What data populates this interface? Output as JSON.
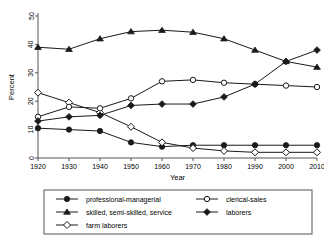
{
  "chart_data": {
    "type": "line",
    "title": "",
    "xlabel": "Year",
    "ylabel": "Percent",
    "x": [
      1920,
      1930,
      1940,
      1950,
      1960,
      1970,
      1980,
      1990,
      2000,
      2010
    ],
    "xlim": [
      1920,
      2010
    ],
    "ylim": [
      0,
      50
    ],
    "xticks": [
      "1920",
      "1930",
      "1940",
      "1950",
      "1960",
      "1970",
      "1980",
      "1990",
      "2000",
      "2010"
    ],
    "yticks": [
      "0",
      "10",
      "20",
      "30",
      "40",
      "50"
    ],
    "grid": false,
    "legend_position": "bottom",
    "series": [
      {
        "name": "professional-managerial",
        "marker": "filled-circle",
        "values": [
          10.5,
          10.0,
          9.5,
          5.5,
          4.0,
          4.5,
          4.5,
          4.5,
          4.5,
          4.5
        ]
      },
      {
        "name": "skilled, semi-skilled, service",
        "marker": "filled-triangle",
        "values": [
          39.0,
          38.3,
          42.0,
          44.5,
          45.0,
          44.3,
          42.0,
          38.0,
          34.0,
          32.0
        ]
      },
      {
        "name": "farm laborers",
        "marker": "open-diamond",
        "values": [
          23.0,
          19.5,
          16.0,
          11.0,
          5.5,
          3.5,
          2.5,
          2.0,
          2.0,
          2.0
        ]
      },
      {
        "name": "clerical-sales",
        "marker": "open-circle",
        "values": [
          14.5,
          18.0,
          17.5,
          21.0,
          27.0,
          27.5,
          26.5,
          26.0,
          25.5,
          25.0
        ]
      },
      {
        "name": "laborers",
        "marker": "filled-diamond",
        "values": [
          13.0,
          14.5,
          15.0,
          18.5,
          19.0,
          19.0,
          21.5,
          26.0,
          34.0,
          38.0
        ]
      }
    ]
  },
  "legend": {
    "entries": [
      {
        "label": "professional-managerial",
        "marker": "filled-circle"
      },
      {
        "label": "clerical-sales",
        "marker": "open-circle"
      },
      {
        "label": "skilled, semi-skilled, service",
        "marker": "filled-triangle"
      },
      {
        "label": "laborers",
        "marker": "filled-diamond"
      },
      {
        "label": "farm laborers",
        "marker": "open-diamond"
      }
    ]
  },
  "colors": {
    "line": "#1a1a1a",
    "axis": "#555555",
    "background": "#ffffff",
    "marker_fill": "#1a1a1a",
    "marker_open": "#ffffff"
  }
}
